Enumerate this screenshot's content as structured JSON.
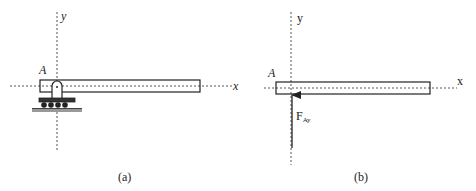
{
  "panel_a": {
    "caption": "(a)",
    "axis_x_label": "x",
    "axis_y_label": "y",
    "point_label": "A",
    "support": "roller-pin-support"
  },
  "panel_b": {
    "caption": "(b)",
    "axis_x_label": "x",
    "axis_y_label": "y",
    "point_label": "A",
    "force_label": "F",
    "force_subscript": "Ay"
  },
  "colors": {
    "line": "#222222",
    "axis": "#555555",
    "ground": "#777777"
  }
}
